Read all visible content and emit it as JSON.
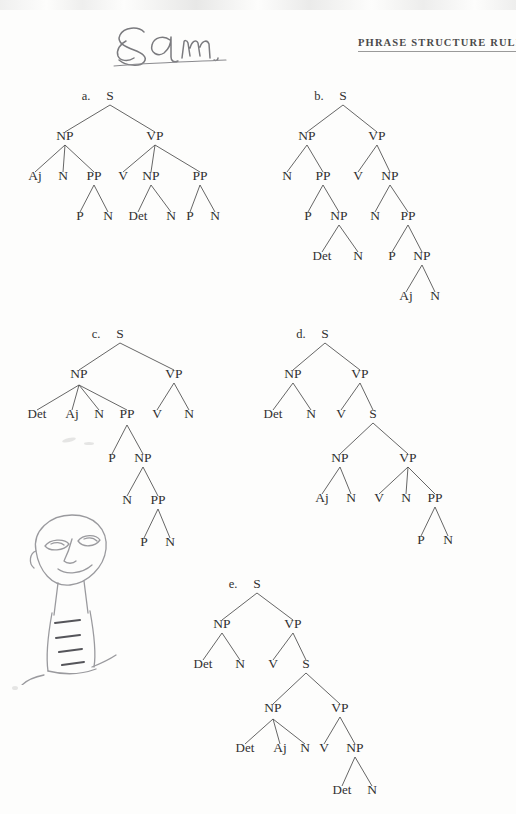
{
  "page": {
    "header_title": "PHRASE STRUCTURE RULES",
    "handwriting": "Sam",
    "doodle_name": "pencil-face-doodle",
    "ink_color": "#303030",
    "branch_color": "#4a4a4a",
    "paper_color": "#fdfdfc"
  },
  "trees": [
    {
      "id": "a",
      "label": "a.",
      "root": "S",
      "nodes": [
        {
          "text": "S",
          "x": 100,
          "y": 16
        },
        {
          "text": "NP",
          "x": 55,
          "y": 56
        },
        {
          "text": "VP",
          "x": 145,
          "y": 56
        },
        {
          "text": "Aj",
          "x": 25,
          "y": 96
        },
        {
          "text": "N",
          "x": 53,
          "y": 96
        },
        {
          "text": "PP",
          "x": 84,
          "y": 96
        },
        {
          "text": "V",
          "x": 113,
          "y": 96
        },
        {
          "text": "NP",
          "x": 141,
          "y": 96
        },
        {
          "text": "PP",
          "x": 190,
          "y": 96
        },
        {
          "text": "P",
          "x": 70,
          "y": 136
        },
        {
          "text": "N",
          "x": 98,
          "y": 136
        },
        {
          "text": "Det",
          "x": 128,
          "y": 136
        },
        {
          "text": "N",
          "x": 161,
          "y": 136
        },
        {
          "text": "P",
          "x": 180,
          "y": 136
        },
        {
          "text": "N",
          "x": 205,
          "y": 136
        }
      ],
      "edges": [
        [
          100,
          21,
          55,
          48
        ],
        [
          100,
          21,
          145,
          48
        ],
        [
          55,
          61,
          25,
          88
        ],
        [
          55,
          61,
          53,
          88
        ],
        [
          55,
          61,
          84,
          88
        ],
        [
          145,
          61,
          113,
          88
        ],
        [
          145,
          61,
          141,
          88
        ],
        [
          145,
          61,
          190,
          88
        ],
        [
          84,
          101,
          70,
          128
        ],
        [
          84,
          101,
          98,
          128
        ],
        [
          141,
          101,
          128,
          128
        ],
        [
          141,
          101,
          161,
          128
        ],
        [
          190,
          101,
          180,
          128
        ],
        [
          190,
          101,
          205,
          128
        ]
      ]
    },
    {
      "id": "b",
      "label": "b.",
      "root": "S",
      "nodes": [
        {
          "text": "S",
          "x": 78,
          "y": 16
        },
        {
          "text": "NP",
          "x": 42,
          "y": 56
        },
        {
          "text": "VP",
          "x": 112,
          "y": 56
        },
        {
          "text": "N",
          "x": 22,
          "y": 96
        },
        {
          "text": "PP",
          "x": 58,
          "y": 96
        },
        {
          "text": "V",
          "x": 93,
          "y": 96
        },
        {
          "text": "NP",
          "x": 125,
          "y": 96
        },
        {
          "text": "P",
          "x": 43,
          "y": 136
        },
        {
          "text": "NP",
          "x": 74,
          "y": 136
        },
        {
          "text": "N",
          "x": 110,
          "y": 136
        },
        {
          "text": "PP",
          "x": 143,
          "y": 136
        },
        {
          "text": "Det",
          "x": 57,
          "y": 176
        },
        {
          "text": "N",
          "x": 93,
          "y": 176
        },
        {
          "text": "P",
          "x": 127,
          "y": 176
        },
        {
          "text": "NP",
          "x": 157,
          "y": 176
        },
        {
          "text": "Aj",
          "x": 141,
          "y": 216
        },
        {
          "text": "N",
          "x": 170,
          "y": 216
        }
      ],
      "edges": [
        [
          78,
          21,
          42,
          48
        ],
        [
          78,
          21,
          112,
          48
        ],
        [
          42,
          61,
          22,
          88
        ],
        [
          42,
          61,
          58,
          88
        ],
        [
          112,
          61,
          93,
          88
        ],
        [
          112,
          61,
          125,
          88
        ],
        [
          58,
          101,
          43,
          128
        ],
        [
          58,
          101,
          74,
          128
        ],
        [
          125,
          101,
          110,
          128
        ],
        [
          125,
          101,
          143,
          128
        ],
        [
          74,
          141,
          57,
          168
        ],
        [
          74,
          141,
          93,
          168
        ],
        [
          143,
          141,
          127,
          168
        ],
        [
          143,
          141,
          157,
          168
        ],
        [
          157,
          181,
          141,
          208
        ],
        [
          157,
          181,
          170,
          208
        ]
      ]
    },
    {
      "id": "c",
      "label": "c.",
      "root": "S",
      "nodes": [
        {
          "text": "S",
          "x": 106,
          "y": 16
        },
        {
          "text": "NP",
          "x": 65,
          "y": 56
        },
        {
          "text": "VP",
          "x": 160,
          "y": 56
        },
        {
          "text": "Det",
          "x": 23,
          "y": 96
        },
        {
          "text": "Aj",
          "x": 58,
          "y": 96
        },
        {
          "text": "N",
          "x": 85,
          "y": 96
        },
        {
          "text": "PP",
          "x": 113,
          "y": 96
        },
        {
          "text": "V",
          "x": 143,
          "y": 96
        },
        {
          "text": "N",
          "x": 175,
          "y": 96
        },
        {
          "text": "P",
          "x": 98,
          "y": 140
        },
        {
          "text": "NP",
          "x": 129,
          "y": 140
        },
        {
          "text": "N",
          "x": 113,
          "y": 182
        },
        {
          "text": "PP",
          "x": 144,
          "y": 182
        },
        {
          "text": "P",
          "x": 130,
          "y": 224
        },
        {
          "text": "N",
          "x": 156,
          "y": 224
        }
      ],
      "edges": [
        [
          106,
          21,
          65,
          48
        ],
        [
          106,
          21,
          160,
          48
        ],
        [
          65,
          63,
          23,
          88
        ],
        [
          65,
          63,
          58,
          88
        ],
        [
          65,
          63,
          85,
          88
        ],
        [
          65,
          63,
          113,
          88
        ],
        [
          160,
          61,
          143,
          88
        ],
        [
          160,
          61,
          175,
          88
        ],
        [
          113,
          103,
          98,
          132
        ],
        [
          113,
          103,
          129,
          132
        ],
        [
          129,
          145,
          113,
          174
        ],
        [
          129,
          145,
          144,
          174
        ],
        [
          144,
          187,
          130,
          216
        ],
        [
          144,
          187,
          156,
          216
        ]
      ]
    },
    {
      "id": "d",
      "label": "d.",
      "root": "S",
      "nodes": [
        {
          "text": "S",
          "x": 60,
          "y": 16
        },
        {
          "text": "NP",
          "x": 28,
          "y": 56
        },
        {
          "text": "VP",
          "x": 95,
          "y": 56
        },
        {
          "text": "Det",
          "x": 8,
          "y": 96
        },
        {
          "text": "N",
          "x": 46,
          "y": 96
        },
        {
          "text": "V",
          "x": 76,
          "y": 96
        },
        {
          "text": "S",
          "x": 108,
          "y": 96
        },
        {
          "text": "NP",
          "x": 75,
          "y": 140
        },
        {
          "text": "VP",
          "x": 143,
          "y": 140
        },
        {
          "text": "Aj",
          "x": 57,
          "y": 180
        },
        {
          "text": "N",
          "x": 86,
          "y": 180
        },
        {
          "text": "V",
          "x": 114,
          "y": 180
        },
        {
          "text": "N",
          "x": 141,
          "y": 180
        },
        {
          "text": "PP",
          "x": 170,
          "y": 180
        },
        {
          "text": "P",
          "x": 156,
          "y": 222
        },
        {
          "text": "N",
          "x": 183,
          "y": 222
        }
      ],
      "edges": [
        [
          60,
          21,
          28,
          48
        ],
        [
          60,
          21,
          95,
          48
        ],
        [
          28,
          61,
          8,
          88
        ],
        [
          28,
          61,
          46,
          88
        ],
        [
          95,
          61,
          76,
          88
        ],
        [
          95,
          61,
          108,
          88
        ],
        [
          108,
          101,
          75,
          132
        ],
        [
          108,
          101,
          143,
          132
        ],
        [
          75,
          145,
          57,
          172
        ],
        [
          75,
          145,
          86,
          172
        ],
        [
          143,
          145,
          114,
          172
        ],
        [
          143,
          145,
          141,
          172
        ],
        [
          143,
          145,
          170,
          172
        ],
        [
          170,
          185,
          156,
          214
        ],
        [
          170,
          185,
          183,
          214
        ]
      ]
    },
    {
      "id": "e",
      "label": "e.",
      "root": "S",
      "nodes": [
        {
          "text": "S",
          "x": 52,
          "y": 16
        },
        {
          "text": "NP",
          "x": 17,
          "y": 56
        },
        {
          "text": "VP",
          "x": 88,
          "y": 56
        },
        {
          "text": "Det",
          "x": -2,
          "y": 96
        },
        {
          "text": "N",
          "x": 35,
          "y": 96
        },
        {
          "text": "V",
          "x": 68,
          "y": 96
        },
        {
          "text": "S",
          "x": 101,
          "y": 96
        },
        {
          "text": "NP",
          "x": 68,
          "y": 140
        },
        {
          "text": "VP",
          "x": 135,
          "y": 140
        },
        {
          "text": "Det",
          "x": 40,
          "y": 180
        },
        {
          "text": "Aj",
          "x": 75,
          "y": 180
        },
        {
          "text": "N",
          "x": 100,
          "y": 180
        },
        {
          "text": "V",
          "x": 119,
          "y": 180
        },
        {
          "text": "NP",
          "x": 150,
          "y": 180
        },
        {
          "text": "Det",
          "x": 137,
          "y": 222
        },
        {
          "text": "N",
          "x": 167,
          "y": 222
        }
      ],
      "edges": [
        [
          52,
          21,
          17,
          48
        ],
        [
          52,
          21,
          88,
          48
        ],
        [
          17,
          61,
          -2,
          88
        ],
        [
          17,
          61,
          35,
          88
        ],
        [
          88,
          61,
          68,
          88
        ],
        [
          88,
          61,
          101,
          88
        ],
        [
          101,
          101,
          68,
          132
        ],
        [
          101,
          101,
          135,
          132
        ],
        [
          68,
          147,
          40,
          172
        ],
        [
          68,
          147,
          75,
          172
        ],
        [
          68,
          147,
          100,
          172
        ],
        [
          135,
          145,
          119,
          172
        ],
        [
          135,
          145,
          150,
          172
        ],
        [
          150,
          185,
          137,
          214
        ],
        [
          150,
          185,
          167,
          214
        ]
      ]
    }
  ]
}
